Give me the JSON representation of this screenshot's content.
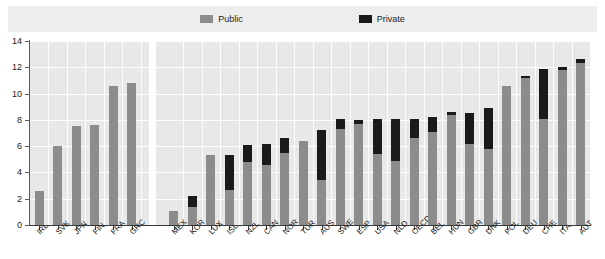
{
  "legend": {
    "items": [
      {
        "label": "Public",
        "color": "#8c8c8c",
        "icon": "square-swatch-icon"
      },
      {
        "label": "Private",
        "color": "#1a1a1a",
        "icon": "square-swatch-icon"
      }
    ]
  },
  "chart_data": {
    "type": "bar",
    "title": "",
    "subtitle": "",
    "xlabel": "",
    "ylabel": "",
    "ylim": [
      0,
      14
    ],
    "yticks": [
      0,
      2,
      4,
      6,
      8,
      10,
      12,
      14
    ],
    "grid": true,
    "stacked": true,
    "legend_position": "top",
    "panels": [
      {
        "name": "left-panel",
        "categories": [
          "IRL",
          "SVK",
          "JPN",
          "FIN",
          "FRA",
          "GRC"
        ],
        "series": [
          {
            "name": "Public",
            "values": [
              2.6,
              6.0,
              7.5,
              7.6,
              10.6,
              10.8
            ]
          },
          {
            "name": "Private",
            "values": [
              0.0,
              0.0,
              0.0,
              0.0,
              0.0,
              0.0
            ]
          }
        ]
      },
      {
        "name": "right-panel",
        "categories": [
          "MEX",
          "KOR",
          "LUX",
          "ISL",
          "NZL",
          "CAN",
          "NOR",
          "TUR",
          "AUS",
          "SWE",
          "ESP",
          "USA",
          "NLD",
          "OECD",
          "BEL",
          "HUN",
          "GBR",
          "DNK",
          "POL",
          "DEU",
          "CHE",
          "ITA",
          "AUT"
        ],
        "series": [
          {
            "name": "Public",
            "values": [
              1.1,
              1.4,
              5.3,
              2.7,
              4.8,
              4.6,
              5.5,
              6.4,
              3.4,
              7.3,
              7.7,
              5.4,
              4.9,
              6.6,
              7.1,
              8.4,
              6.2,
              5.8,
              10.6,
              11.2,
              8.1,
              11.8,
              12.3
            ]
          },
          {
            "name": "Private",
            "values": [
              0.0,
              0.8,
              0.0,
              2.6,
              1.3,
              1.6,
              1.1,
              0.0,
              3.8,
              0.8,
              0.3,
              2.7,
              3.2,
              1.5,
              1.1,
              0.2,
              2.3,
              3.1,
              0.0,
              0.1,
              3.8,
              0.2,
              0.3
            ]
          }
        ]
      }
    ],
    "colors": {
      "public": "#8c8c8c",
      "private": "#1a1a1a",
      "plot_background": "#e8e8e8",
      "gridline": "#fdfdfd",
      "axis": "#3a3a3a"
    }
  }
}
